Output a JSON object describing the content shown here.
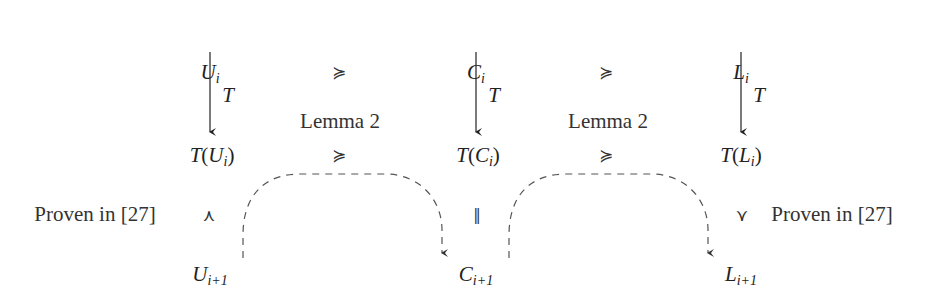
{
  "diagram": {
    "columns": [
      {
        "id": "U",
        "top": {
          "base": "U",
          "sub": "i"
        },
        "mapped": {
          "fn": "T",
          "base": "U",
          "sub": "i"
        },
        "bottom": {
          "base": "U",
          "sub": "i+1"
        },
        "arrow_label": "T"
      },
      {
        "id": "C",
        "top": {
          "base": "C",
          "sub": "i"
        },
        "mapped": {
          "fn": "T",
          "base": "C",
          "sub": "i"
        },
        "bottom": {
          "base": "C",
          "sub": "i+1"
        },
        "arrow_label": "T"
      },
      {
        "id": "L",
        "top": {
          "base": "L",
          "sub": "i"
        },
        "mapped": {
          "fn": "T",
          "base": "L",
          "sub": "i"
        },
        "bottom": {
          "base": "L",
          "sub": "i+1"
        },
        "arrow_label": "T"
      }
    ],
    "top_relations": [
      "≽",
      "≽"
    ],
    "mid_relations": [
      "≽",
      "≽"
    ],
    "mid_relation_labels": [
      "Lemma 2",
      "Lemma 2"
    ],
    "vertical_relations": {
      "left": {
        "symbol": "⋏",
        "label": "Proven in [27]"
      },
      "center": {
        "symbol": "‖"
      },
      "right": {
        "symbol": "⋎",
        "label": "Proven in [27]"
      }
    },
    "dashed_arrows": [
      {
        "from": "U_{i+1}",
        "to": "C_{i+1}"
      },
      {
        "from": "C_{i+1}",
        "to": "L_{i+1}"
      }
    ],
    "colors": {
      "ink": "#222222",
      "dashed": "#555555",
      "background": "#ffffff"
    }
  }
}
